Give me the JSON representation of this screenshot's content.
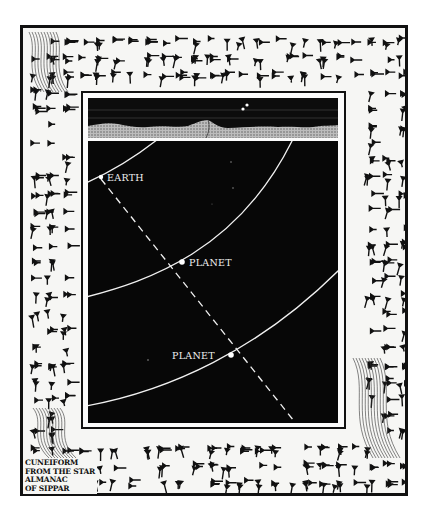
{
  "illustration": {
    "title": "Planetary alignment diagram with cuneiform border",
    "labels": {
      "earth": "EARTH",
      "planet_inner": "PLANET",
      "planet_outer": "PLANET"
    },
    "caption_lines": [
      "CUNEIFORM",
      "FROM THE STAR",
      "ALMANAC",
      "OF SIPPAR"
    ],
    "colors": {
      "ink": "#111111",
      "paper": "#f6f6f4",
      "night_sky": "#070707",
      "orbit_line": "#f0f0f0"
    }
  }
}
